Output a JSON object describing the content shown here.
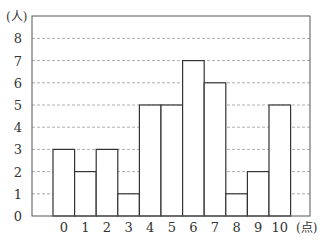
{
  "chart_data": {
    "type": "bar",
    "title": "",
    "xlabel": "(点)",
    "ylabel": "(人)",
    "categories": [
      "0",
      "1",
      "2",
      "3",
      "4",
      "5",
      "6",
      "7",
      "8",
      "9",
      "10"
    ],
    "values": [
      3,
      2,
      3,
      1,
      5,
      5,
      7,
      6,
      1,
      2,
      5
    ],
    "yticks": [
      0,
      1,
      2,
      3,
      4,
      5,
      6,
      7,
      8
    ],
    "ylim": [
      0,
      9
    ],
    "grid": "horizontal dashed",
    "legend": "none",
    "bar_style": "histogram, adjacent bars, white fill, dark outline"
  },
  "colors": {
    "bar_fill": "#ffffff",
    "bar_stroke": "#333333",
    "grid": "#999999",
    "axis": "#555555"
  }
}
